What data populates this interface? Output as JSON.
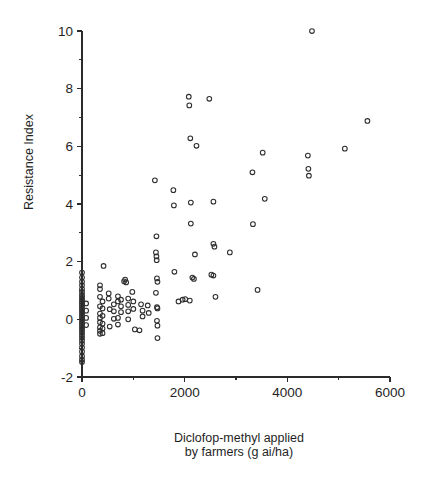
{
  "chart_data": {
    "type": "scatter",
    "title": "",
    "subtitle": "",
    "xlabel_line1": "Diclofop-methyl applied",
    "xlabel_line2": "by farmers (g ai/ha)",
    "ylabel": "Resistance Index",
    "xlim": [
      0,
      6000
    ],
    "ylim": [
      -2,
      10
    ],
    "x_major_ticks": [
      0,
      2000,
      4000,
      6000
    ],
    "x_major_tick_labels": [
      "0",
      "2000",
      "4000",
      "6000"
    ],
    "x_minor_ticks": [
      1000,
      3000,
      5000
    ],
    "y_major_ticks": [
      -2,
      0,
      2,
      4,
      6,
      8,
      10
    ],
    "y_major_tick_labels": [
      "-2",
      "0",
      "2",
      "4",
      "6",
      "8",
      "10"
    ],
    "y_minor_ticks": [
      -1,
      1,
      3,
      5,
      7,
      9
    ],
    "grid": false,
    "legend": null,
    "marker": "open-circle",
    "marker_color": "#2e2e2e",
    "series": [
      {
        "name": "Field populations",
        "points": [
          [
            0,
            1.62
          ],
          [
            0,
            1.45
          ],
          [
            0,
            1.3
          ],
          [
            0,
            1.18
          ],
          [
            0,
            1.05
          ],
          [
            0,
            0.95
          ],
          [
            0,
            0.85
          ],
          [
            0,
            0.78
          ],
          [
            0,
            0.7
          ],
          [
            0,
            0.62
          ],
          [
            0,
            0.55
          ],
          [
            0,
            0.48
          ],
          [
            0,
            0.4
          ],
          [
            0,
            0.33
          ],
          [
            0,
            0.26
          ],
          [
            0,
            0.18
          ],
          [
            0,
            0.1
          ],
          [
            0,
            0.02
          ],
          [
            0,
            -0.06
          ],
          [
            0,
            -0.14
          ],
          [
            0,
            -0.22
          ],
          [
            0,
            -0.3
          ],
          [
            0,
            -0.38
          ],
          [
            0,
            -0.46
          ],
          [
            0,
            -0.55
          ],
          [
            0,
            -0.64
          ],
          [
            0,
            -0.74
          ],
          [
            0,
            -0.85
          ],
          [
            0,
            -0.98
          ],
          [
            0,
            -1.12
          ],
          [
            0,
            -1.28
          ],
          [
            0,
            -1.4
          ],
          [
            0,
            -1.48
          ],
          [
            80,
            0.55
          ],
          [
            80,
            0.3
          ],
          [
            80,
            0.05
          ],
          [
            80,
            -0.2
          ],
          [
            420,
            1.85
          ],
          [
            350,
            1.18
          ],
          [
            350,
            1.05
          ],
          [
            350,
            0.78
          ],
          [
            350,
            0.45
          ],
          [
            350,
            0.2
          ],
          [
            350,
            0.05
          ],
          [
            350,
            -0.1
          ],
          [
            350,
            -0.28
          ],
          [
            350,
            -0.4
          ],
          [
            350,
            -0.5
          ],
          [
            400,
            0.62
          ],
          [
            400,
            0.38
          ],
          [
            400,
            0.12
          ],
          [
            400,
            -0.15
          ],
          [
            400,
            -0.32
          ],
          [
            400,
            -0.48
          ],
          [
            520,
            0.9
          ],
          [
            520,
            0.72
          ],
          [
            540,
            0.35
          ],
          [
            540,
            -0.25
          ],
          [
            620,
            0.52
          ],
          [
            620,
            0.28
          ],
          [
            620,
            0.02
          ],
          [
            700,
            0.8
          ],
          [
            700,
            0.62
          ],
          [
            700,
            0.05
          ],
          [
            700,
            -0.18
          ],
          [
            760,
            0.68
          ],
          [
            760,
            0.45
          ],
          [
            760,
            0.25
          ],
          [
            820,
            1.32
          ],
          [
            840,
            1.38
          ],
          [
            860,
            1.28
          ],
          [
            900,
            0.72
          ],
          [
            900,
            0.5
          ],
          [
            900,
            0.28
          ],
          [
            900,
            0.0
          ],
          [
            980,
            0.95
          ],
          [
            1000,
            0.62
          ],
          [
            1000,
            0.36
          ],
          [
            1030,
            -0.35
          ],
          [
            1120,
            -0.38
          ],
          [
            1150,
            0.52
          ],
          [
            1180,
            0.3
          ],
          [
            1180,
            0.1
          ],
          [
            1280,
            0.48
          ],
          [
            1300,
            0.22
          ],
          [
            1420,
            4.82
          ],
          [
            1450,
            2.88
          ],
          [
            1440,
            2.32
          ],
          [
            1450,
            2.18
          ],
          [
            1455,
            2.05
          ],
          [
            1460,
            1.42
          ],
          [
            1470,
            1.3
          ],
          [
            1440,
            0.92
          ],
          [
            1460,
            0.42
          ],
          [
            1470,
            0.38
          ],
          [
            1460,
            -0.05
          ],
          [
            1470,
            -0.22
          ],
          [
            1470,
            -0.65
          ],
          [
            1780,
            4.48
          ],
          [
            1790,
            3.95
          ],
          [
            1800,
            1.65
          ],
          [
            1880,
            0.62
          ],
          [
            1960,
            0.68
          ],
          [
            2010,
            0.7
          ],
          [
            2080,
            7.72
          ],
          [
            2090,
            7.42
          ],
          [
            2110,
            6.28
          ],
          [
            2230,
            6.02
          ],
          [
            2120,
            4.05
          ],
          [
            2120,
            3.32
          ],
          [
            2200,
            2.25
          ],
          [
            2150,
            1.45
          ],
          [
            2180,
            1.4
          ],
          [
            2100,
            0.65
          ],
          [
            2480,
            7.65
          ],
          [
            2560,
            4.08
          ],
          [
            2560,
            2.62
          ],
          [
            2580,
            2.52
          ],
          [
            2520,
            1.55
          ],
          [
            2560,
            1.52
          ],
          [
            2600,
            0.78
          ],
          [
            2880,
            2.32
          ],
          [
            3320,
            5.1
          ],
          [
            3330,
            3.3
          ],
          [
            3420,
            1.02
          ],
          [
            3520,
            5.78
          ],
          [
            3560,
            4.18
          ],
          [
            4400,
            5.68
          ],
          [
            4410,
            5.22
          ],
          [
            4420,
            4.98
          ],
          [
            4480,
            10.0
          ],
          [
            5120,
            5.92
          ],
          [
            5560,
            6.88
          ]
        ]
      }
    ]
  },
  "geometry": {
    "plot_left": 82,
    "plot_right": 390,
    "plot_top": 31,
    "plot_bottom": 377
  }
}
